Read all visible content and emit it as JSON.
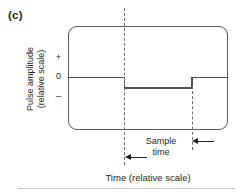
{
  "figure": {
    "panel_label": "(c)",
    "y_axis": {
      "title_line1": "Pulse amplitude",
      "title_line2": "(relative scale)",
      "ticks": [
        "+",
        "0",
        "–"
      ]
    },
    "x_axis": {
      "title": "Time (relative scale)"
    },
    "annotation": {
      "line1": "Sample",
      "line2": "time"
    },
    "colors": {
      "frame": "#58595b",
      "waveform": "#4d4e50",
      "dashed": "#6d6e70",
      "text": "#231f20",
      "rule": "#c9cacc"
    }
  },
  "chart_data": {
    "type": "line",
    "title": "(c)",
    "xlabel": "Time (relative scale)",
    "ylabel": "Pulse amplitude (relative scale)",
    "ytick_labels": [
      "+",
      "0",
      "–"
    ],
    "ylim": [
      -1,
      1
    ],
    "grid": false,
    "legend": null,
    "series": [
      {
        "name": "pulse",
        "style": "step",
        "x": [
          0.0,
          0.35,
          0.35,
          0.77,
          0.77,
          1.0
        ],
        "y": [
          0.0,
          0.0,
          -0.2,
          -0.2,
          0.0,
          0.0
        ]
      }
    ],
    "annotations": [
      {
        "text": "Sample time",
        "type": "dimension",
        "from_x": 0.35,
        "to_x": 0.77,
        "arrow_style": "inward-double"
      },
      {
        "text": "",
        "type": "vline-dashed",
        "x": 0.35
      },
      {
        "text": "",
        "type": "vline-dashed",
        "x": 0.77
      }
    ]
  }
}
